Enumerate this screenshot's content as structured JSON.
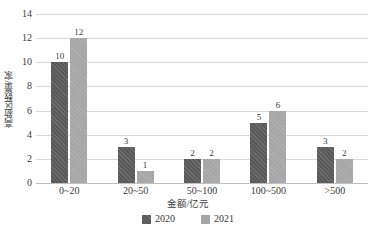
{
  "chart_data": {
    "type": "bar",
    "title": "",
    "categories": [
      "0~20",
      "20~50",
      "50~100",
      "100~500",
      ">500"
    ],
    "series": [
      {
        "name": "2020",
        "values": [
          10,
          3,
          2,
          5,
          3
        ],
        "color": "#595959"
      },
      {
        "name": "2021",
        "values": [
          12,
          1,
          2,
          6,
          2
        ],
        "color": "#a6a6a6"
      }
    ],
    "xlabel": "金额/亿元",
    "ylabel": "高新区数量/家",
    "ylim": [
      0,
      14
    ],
    "ytick_labels": [
      "0",
      "2",
      "4",
      "6",
      "8",
      "10",
      "12",
      "14"
    ],
    "ytick_values": [
      0,
      2,
      4,
      6,
      8,
      10,
      12,
      14
    ],
    "grid": true,
    "grid_axis": "y",
    "legend_position": "bottom",
    "data_labels": true
  }
}
